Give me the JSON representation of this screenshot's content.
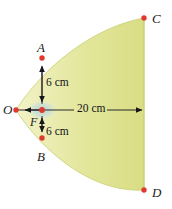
{
  "figure": {
    "background_color": "#ffffff",
    "fill_color_light": "#eff0b8",
    "fill_color_main": "#dde08a",
    "fill_edge_color": "#c9cf74",
    "point_color": "#e03a2f",
    "line_color": "#15151c",
    "focus_glow_color": "#bcd8e0",
    "points": [
      {
        "id": "A",
        "label": "A",
        "x": 42,
        "y": 58
      },
      {
        "id": "B",
        "label": "B",
        "x": 42,
        "y": 138
      },
      {
        "id": "C",
        "label": "C",
        "x": 144,
        "y": 18
      },
      {
        "id": "D",
        "label": "D",
        "x": 144,
        "y": 190
      },
      {
        "id": "O",
        "label": "O",
        "x": 16,
        "y": 110
      },
      {
        "id": "F",
        "label": "F",
        "x": 42,
        "y": 110
      }
    ],
    "dimensions": [
      {
        "id": "upper-6cm",
        "label": "6 cm",
        "value": 6,
        "unit": "cm",
        "from": "F",
        "to": "A",
        "orientation": "vertical"
      },
      {
        "id": "lower-6cm",
        "label": "6 cm",
        "value": 6,
        "unit": "cm",
        "from": "F",
        "to": "B",
        "orientation": "vertical"
      },
      {
        "id": "axis-20cm",
        "label": "20 cm",
        "value": 20,
        "unit": "cm",
        "from": "F",
        "to": "CD",
        "orientation": "horizontal"
      }
    ]
  }
}
